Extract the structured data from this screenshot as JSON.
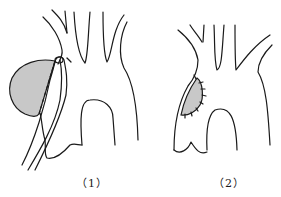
{
  "figure": {
    "panels": [
      {
        "label": "（1）",
        "description": "aortic arch aneurysm with side-biting vascular clamp applied at the neck"
      },
      {
        "label": "（2）",
        "description": "aortic arch after aneurysm resection with patch sutured"
      }
    ],
    "colors": {
      "line": "#1a1a1a",
      "shading": "#c8c8c8",
      "background": "#ffffff"
    }
  }
}
